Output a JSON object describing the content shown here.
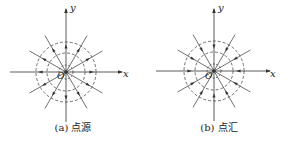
{
  "figure": {
    "panels": [
      {
        "id": "a",
        "caption": "(a) 点源",
        "type": "point-source",
        "flow_direction": "outward",
        "axis_x_label": "x",
        "axis_y_label": "y",
        "origin_label": "O"
      },
      {
        "id": "b",
        "caption": "(b) 点汇",
        "type": "point-sink",
        "flow_direction": "inward",
        "axis_x_label": "x",
        "axis_y_label": "y",
        "origin_label": "O"
      }
    ],
    "equipotential_circles": 3,
    "streamline_count": 12,
    "line_color": "#333333"
  }
}
